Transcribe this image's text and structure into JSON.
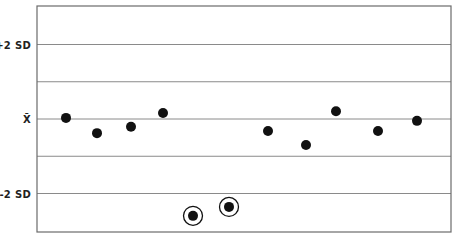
{
  "chart_data": {
    "type": "scatter",
    "title": "",
    "xlabel": "",
    "ylabel": "",
    "y_unit": "standard deviations from mean",
    "ylim": [
      -3.05,
      3.05
    ],
    "grid": true,
    "legend": null,
    "y_ticks": [
      {
        "value": 2,
        "label": "+2 SD"
      },
      {
        "value": 1,
        "label": ""
      },
      {
        "value": 0,
        "label": "X̄"
      },
      {
        "value": -1,
        "label": ""
      },
      {
        "value": -2,
        "label": "-2 SD"
      }
    ],
    "x": [
      1,
      2,
      3,
      4,
      5,
      6,
      7,
      8,
      9,
      10,
      11
    ],
    "x_pixel": [
      66,
      97,
      131,
      163,
      193,
      229,
      268,
      306,
      336,
      378,
      417
    ],
    "values": [
      0.03,
      -0.38,
      -0.21,
      0.16,
      -2.6,
      -2.36,
      -0.32,
      -0.7,
      0.21,
      -0.32,
      -0.05
    ],
    "highlighted": [
      false,
      false,
      false,
      false,
      true,
      true,
      false,
      false,
      false,
      false,
      false
    ],
    "annotations": [
      "Two points beyond -2 SD are circled (out-of-control values)"
    ]
  },
  "colors": {
    "axis": "#6b6b6b",
    "grid": "#8a8a8a",
    "point": "#111111",
    "label": "#222222"
  }
}
